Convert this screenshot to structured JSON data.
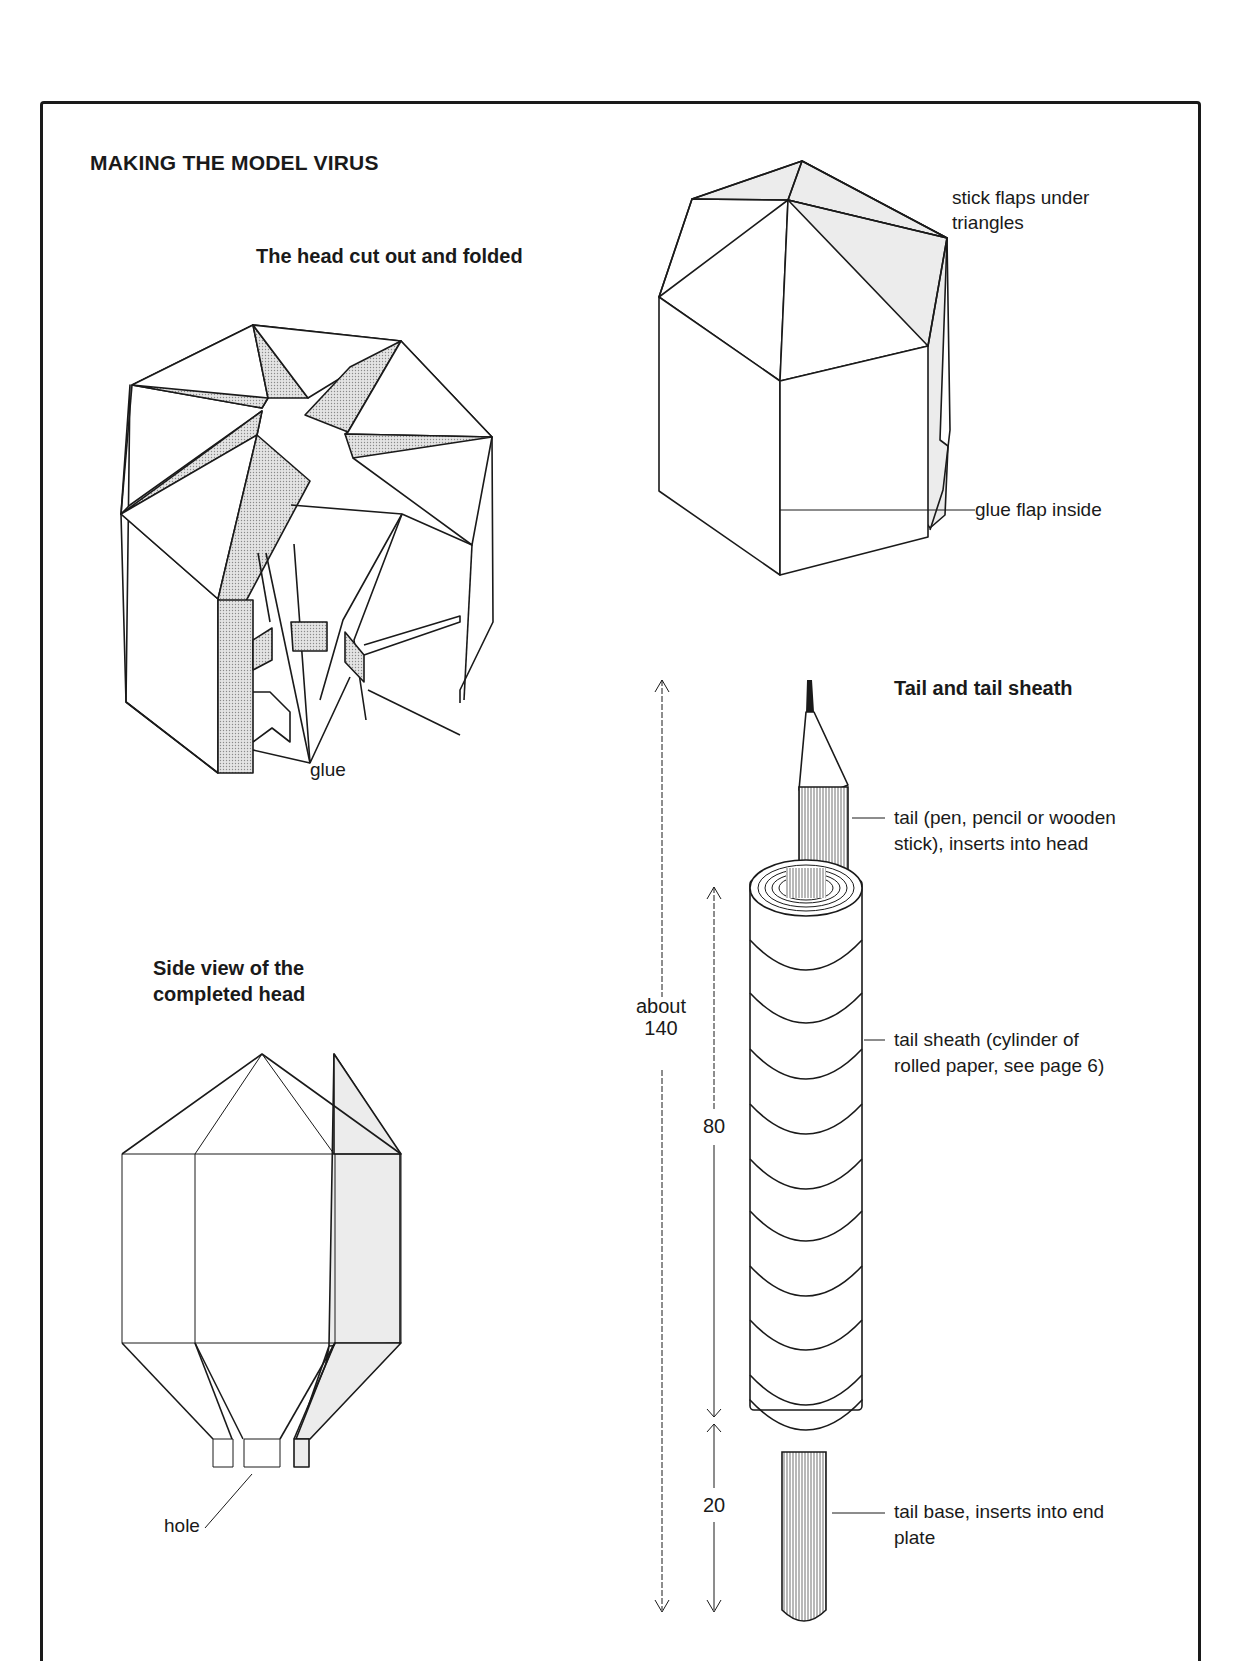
{
  "page": {
    "title": "MAKING THE MODEL VIRUS"
  },
  "figures": {
    "folded_head": {
      "heading": "The head cut out and folded",
      "labels": {
        "glue": "glue"
      }
    },
    "assembled_head": {
      "labels": {
        "stick_flaps_line1": "stick flaps under",
        "stick_flaps_line2": "triangles",
        "glue_flap": "glue flap inside"
      }
    },
    "side_view": {
      "heading_line1": "Side view of the",
      "heading_line2": "completed head",
      "labels": {
        "hole": "hole"
      }
    },
    "tail": {
      "heading": "Tail and tail sheath",
      "labels": {
        "tail_line1": "tail (pen, pencil or wooden",
        "tail_line2": "stick), inserts into head",
        "sheath_line1": "tail sheath (cylinder of",
        "sheath_line2": "rolled paper, see page 6)",
        "base_line1": "tail base, inserts into end",
        "base_line2": "plate"
      },
      "dimensions": {
        "total_line1": "about",
        "total_line2": "140",
        "sheath": "80",
        "base": "20"
      }
    }
  },
  "colors": {
    "ink": "#1a1a1a",
    "shade": "#ececec",
    "paper": "#ffffff"
  }
}
